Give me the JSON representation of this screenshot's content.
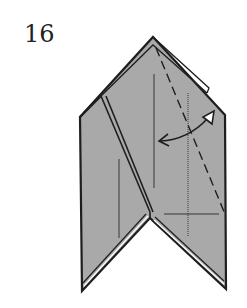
{
  "diagram": {
    "step_number": "16",
    "colors": {
      "paper_fill": "#a9a9a9",
      "outline": "#1e1e1e",
      "background": "#ffffff",
      "arrow_head_fill": "#ffffff"
    },
    "elements": [
      {
        "name": "model-outline",
        "type": "polygon"
      },
      {
        "name": "layer-edge-double-line",
        "type": "line"
      },
      {
        "name": "valley-fold-dashed-line",
        "type": "dashed-line"
      },
      {
        "name": "crease-lines",
        "type": "line"
      },
      {
        "name": "fold-unfold-arrow",
        "type": "arrow",
        "meaning": "fold and unfold"
      }
    ]
  }
}
